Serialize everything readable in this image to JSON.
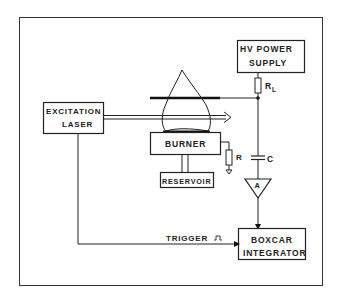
{
  "diagram": {
    "colors": {
      "ink": "#222222",
      "background": "#ffffff"
    },
    "blocks": {
      "hv_supply": {
        "line1": "HV POWER",
        "line2": "SUPPLY"
      },
      "laser": {
        "line1": "EXCITATION",
        "line2": "LASER"
      },
      "burner": {
        "label": "BURNER"
      },
      "reservoir": {
        "label": "RESERVOIR"
      },
      "boxcar": {
        "line1": "BOXCAR",
        "line2": "INTEGRATOR"
      },
      "amplifier": {
        "label": "A"
      }
    },
    "components": {
      "load_resistor": {
        "label": "R",
        "subscript": "L"
      },
      "resistor": {
        "label": "R"
      },
      "capacitor": {
        "label": "C"
      }
    },
    "signals": {
      "trigger": {
        "label": "TRIGGER",
        "pulse_symbol": "⎍"
      }
    }
  }
}
